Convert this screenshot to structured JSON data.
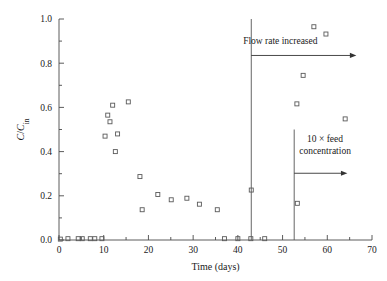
{
  "chart_data": {
    "type": "scatter",
    "title": "",
    "xlabel": "Time (days)",
    "ylabel": "C/C_in",
    "ylabel_parts": {
      "numerator": "C",
      "slash": "/",
      "denominator": "C",
      "subscript": "in"
    },
    "xlim": [
      0,
      70
    ],
    "ylim": [
      0.0,
      1.0
    ],
    "xticks": [
      0,
      10,
      20,
      30,
      40,
      50,
      60,
      70
    ],
    "xtick_labels": [
      "0",
      "10",
      "20",
      "30",
      "40",
      "50",
      "60",
      "70"
    ],
    "yticks": [
      0.0,
      0.2,
      0.4,
      0.6,
      0.8,
      1.0
    ],
    "ytick_labels": [
      "0.0",
      "0.2",
      "0.4",
      "0.6",
      "0.8",
      "1.0"
    ],
    "minor_yticks": [
      0.1,
      0.3,
      0.5,
      0.7,
      0.9
    ],
    "grid": false,
    "legend": false,
    "marker": "open-square",
    "marker_color": "#5a5a5a",
    "series": [
      {
        "name": "C/Cin",
        "points": [
          [
            0.3,
            0.004
          ],
          [
            2.0,
            0.006
          ],
          [
            4.3,
            0.006
          ],
          [
            5.2,
            0.006
          ],
          [
            7.0,
            0.006
          ],
          [
            8.0,
            0.006
          ],
          [
            9.6,
            0.006
          ],
          [
            10.3,
            0.47
          ],
          [
            10.9,
            0.565
          ],
          [
            11.4,
            0.535
          ],
          [
            12.0,
            0.61
          ],
          [
            12.6,
            0.4
          ],
          [
            13.1,
            0.48
          ],
          [
            15.5,
            0.625
          ],
          [
            18.1,
            0.287
          ],
          [
            18.6,
            0.137
          ],
          [
            22.1,
            0.206
          ],
          [
            25.1,
            0.182
          ],
          [
            28.6,
            0.189
          ],
          [
            31.4,
            0.162
          ],
          [
            35.4,
            0.137
          ],
          [
            37.0,
            0.006
          ],
          [
            40.0,
            0.006
          ],
          [
            42.9,
            0.006
          ],
          [
            43.0,
            0.226
          ],
          [
            46.0,
            0.006
          ],
          [
            53.2,
            0.616
          ],
          [
            53.3,
            0.166
          ],
          [
            54.6,
            0.745
          ],
          [
            57.0,
            0.965
          ],
          [
            59.7,
            0.932
          ],
          [
            64.0,
            0.548
          ]
        ]
      }
    ],
    "event_lines": [
      {
        "name": "flow-rate-increase-line",
        "x": 43.0,
        "y_from": 0.0,
        "y_to": 1.0
      },
      {
        "name": "feed-concentration-line",
        "x": 52.6,
        "y_from": 0.0,
        "y_to": 0.5
      }
    ],
    "annotations": [
      {
        "name": "flow-rate-increased-annotation",
        "text": "Flow rate increased",
        "text_lines": [
          "Flow rate increased"
        ],
        "text_x": 49.5,
        "text_y": 0.885,
        "arrow_from_x": 43.0,
        "arrow_to_x": 66.5,
        "arrow_y": 0.835
      },
      {
        "name": "feed-concentration-annotation",
        "text": "10 × feed concentration",
        "text_lines": [
          "10 × feed",
          "concentration"
        ],
        "text_x": 59.5,
        "text_y": 0.445,
        "arrow_from_x": 52.6,
        "arrow_to_x": 64.5,
        "arrow_y": 0.302
      }
    ]
  }
}
